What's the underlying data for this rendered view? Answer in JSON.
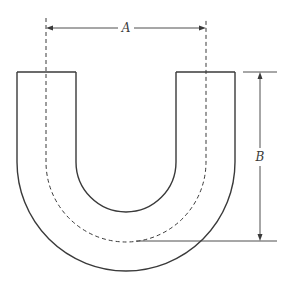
{
  "figure": {
    "type": "U-bend pipe dimension drawing",
    "labels": {
      "width_dimension": "A",
      "height_dimension": "B"
    },
    "colors": {
      "stroke": "#3a3a3a",
      "background": "#ffffff"
    }
  }
}
